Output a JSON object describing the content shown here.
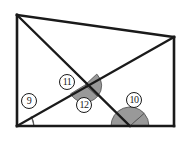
{
  "figure": {
    "type": "geometry-diagram",
    "width": 188,
    "height": 141,
    "background_color": "#ffffff",
    "stroke_color": "#1a1a1a",
    "arc_fill_color": "#999999",
    "arc_stroke_color": "#4d4d4d"
  },
  "vertices": {
    "top_left": {
      "x": 17,
      "y": 15
    },
    "bottom_left": {
      "x": 17,
      "y": 126
    },
    "bottom_right": {
      "x": 174,
      "y": 126
    },
    "top_right": {
      "x": 174,
      "y": 37
    },
    "bottom_mid": {
      "x": 130,
      "y": 126
    },
    "intersection": {
      "x": 85,
      "y": 85
    }
  },
  "segments": [
    {
      "name": "left-side",
      "from": "top_left",
      "to": "bottom_left"
    },
    {
      "name": "bottom-side",
      "from": "bottom_left",
      "to": "bottom_right"
    },
    {
      "name": "right-side",
      "from": "bottom_right",
      "to": "top_right"
    },
    {
      "name": "top-side",
      "from": "top_left",
      "to": "top_right"
    },
    {
      "name": "descending-transversal",
      "from": "top_left",
      "to": "bottom_mid"
    },
    {
      "name": "ascending-transversal",
      "from": "bottom_left",
      "to": "top_right"
    }
  ],
  "angles": [
    {
      "id": "angle-9",
      "label": "⑨",
      "number": "9",
      "vertex": "bottom_left",
      "label_x": 21,
      "label_y": 93,
      "arc_radius": 17,
      "shaded": true
    },
    {
      "id": "angle-11",
      "label": "⑪",
      "number": "11",
      "vertex": "intersection",
      "label_x": 59,
      "label_y": 74,
      "arc_radius": 15,
      "shaded": true
    },
    {
      "id": "angle-12",
      "label": "⑫",
      "number": "12",
      "vertex": "intersection",
      "label_x": 76,
      "label_y": 97,
      "arc_radius": 15,
      "shaded": true
    },
    {
      "id": "angle-10",
      "label": "⑩",
      "number": "10",
      "vertex": "bottom_mid",
      "label_x": 126,
      "label_y": 92,
      "arc_radius": 19,
      "shaded": true
    }
  ]
}
